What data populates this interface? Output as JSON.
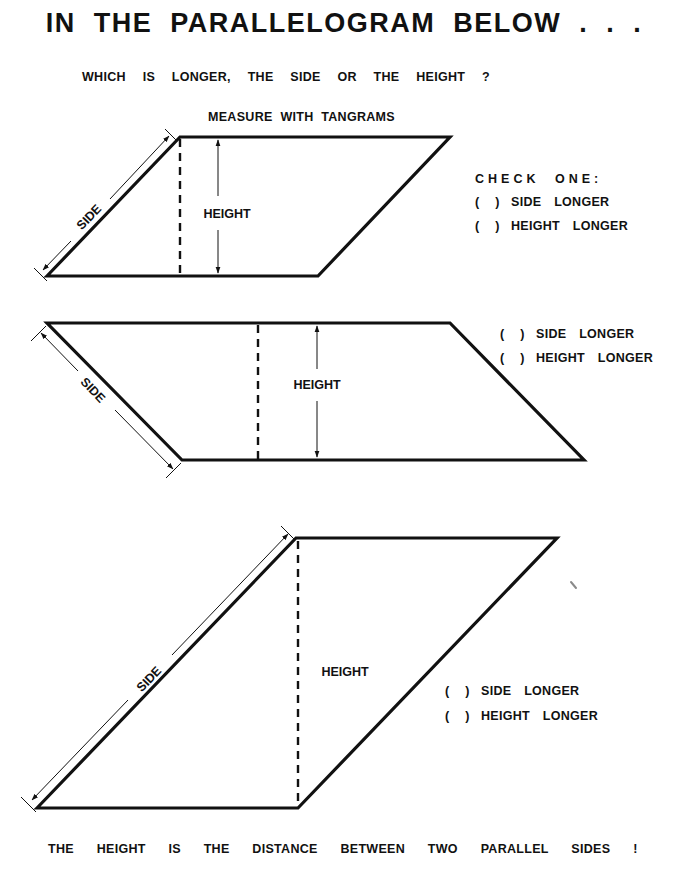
{
  "page": {
    "title": "IN THE PARALLELOGRAM BELOW . . .",
    "question": "WHICH IS LONGER, THE SIDE OR THE HEIGHT ?",
    "instruction": "MEASURE WITH TANGRAMS",
    "check_heading": "CHECK ONE:",
    "footer": "THE HEIGHT IS THE DISTANCE BETWEEN TWO PARALLEL SIDES !"
  },
  "colors": {
    "ink": "#111111",
    "paper": "#ffffff"
  },
  "parallelograms": [
    {
      "side_label": "SIDE",
      "height_label": "HEIGHT",
      "options": [
        {
          "paren": "( )",
          "label": "SIDE LONGER"
        },
        {
          "paren": "( )",
          "label": "HEIGHT LONGER"
        }
      ]
    },
    {
      "side_label": "SIDE",
      "height_label": "HEIGHT",
      "options": [
        {
          "paren": "( )",
          "label": "SIDE LONGER"
        },
        {
          "paren": "( )",
          "label": "HEIGHT LONGER"
        }
      ]
    },
    {
      "side_label": "SIDE",
      "height_label": "HEIGHT",
      "options": [
        {
          "paren": "( )",
          "label": "SIDE LONGER"
        },
        {
          "paren": "( )",
          "label": "HEIGHT LONGER"
        }
      ]
    }
  ]
}
